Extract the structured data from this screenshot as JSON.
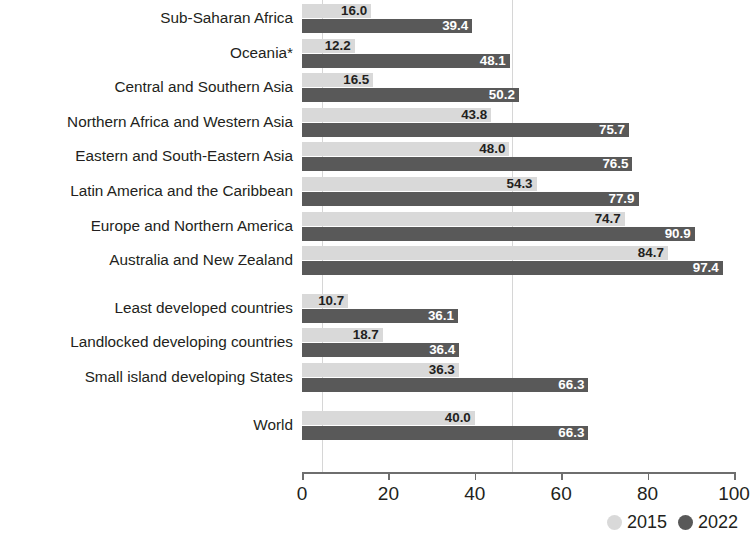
{
  "chart_data": {
    "type": "bar",
    "orientation": "horizontal",
    "title": "",
    "subtitle": "",
    "xlabel": "",
    "ylabel": "",
    "xlim": [
      0,
      100
    ],
    "xticks": [
      0,
      20,
      40,
      60,
      80,
      100
    ],
    "xtick_labels": [
      "0",
      "20",
      "40",
      "60",
      "80",
      "100"
    ],
    "grid": true,
    "gridlines_x": [
      4.6,
      48.6
    ],
    "legend_position": "bottom-right",
    "categories": [
      "Sub-Saharan Africa",
      "Oceania*",
      "Central and Southern Asia",
      "Northern Africa and Western Asia",
      "Eastern and South-Eastern Asia",
      "Latin America and the Caribbean",
      "Europe and Northern America",
      "Australia and New Zealand",
      "Least developed countries",
      "Landlocked developing countries",
      "Small island developing States",
      "World"
    ],
    "series": [
      {
        "name": "2015",
        "color": "#d9d9d9",
        "values": [
          16.0,
          12.2,
          16.5,
          43.8,
          48.0,
          54.3,
          74.7,
          84.7,
          10.7,
          18.7,
          36.3,
          40.0
        ],
        "value_labels": [
          "16.0",
          "12.2",
          "16.5",
          "43.8",
          "48.0",
          "54.3",
          "74.7",
          "84.7",
          "10.7",
          "18.7",
          "36.3",
          "40.0"
        ]
      },
      {
        "name": "2022",
        "color": "#595959",
        "values": [
          39.4,
          48.1,
          50.2,
          75.7,
          76.5,
          77.9,
          90.9,
          97.4,
          36.1,
          36.4,
          66.3,
          66.3
        ],
        "value_labels": [
          "39.4",
          "48.1",
          "50.2",
          "75.7",
          "76.5",
          "77.9",
          "90.9",
          "97.4",
          "36.1",
          "36.4",
          "66.3",
          "66.3"
        ]
      }
    ],
    "group_breaks_after": [
      7,
      10
    ]
  },
  "legend": {
    "items": [
      {
        "label": "2015",
        "color": "#d9d9d9",
        "icon": "circle-icon"
      },
      {
        "label": "2022",
        "color": "#595959",
        "icon": "circle-icon"
      }
    ]
  }
}
